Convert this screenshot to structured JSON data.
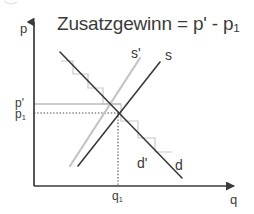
{
  "figure": {
    "kind": "economics-supply-demand-diagram",
    "width": 254,
    "height": 214,
    "background": "#ffffff",
    "title": "Zusatzgewinn = p' - p",
    "title_sub": "1",
    "title_full": "Zusatzgewinn = p' - p₁"
  },
  "axes": {
    "y_label": "p",
    "x_label": "q",
    "origin": {
      "x": 34,
      "y": 186
    },
    "y_top": 18,
    "x_right": 240,
    "axis_color": "#3a3a3a"
  },
  "ticks": {
    "y": [
      {
        "id": "p-prime",
        "label": "p'",
        "label_sub": "",
        "value_y": 104
      },
      {
        "id": "p-one",
        "label": "p",
        "label_sub": "1",
        "value_y": 113
      }
    ],
    "x": [
      {
        "id": "q-one",
        "label": "q",
        "label_sub": "1",
        "value_x": 118
      }
    ]
  },
  "guides": [
    {
      "id": "p-prime-guide",
      "style": "solid-light",
      "color": "#bdbdbd",
      "from_x": 34,
      "to_x": 121,
      "y": 104
    },
    {
      "id": "p-one-guide",
      "style": "dotted",
      "color": "#4a4a4a",
      "from_x": 34,
      "to_x": 120,
      "y": 113
    },
    {
      "id": "q-one-guide",
      "style": "dotted",
      "color": "#4a4a4a",
      "x": 118,
      "from_y": 113,
      "to_y": 186
    }
  ],
  "curves": [
    {
      "id": "demand-d",
      "label": "d",
      "label_x": 178,
      "label_y": 160,
      "color": "#3a3a3a",
      "width": 1.6,
      "x1": 60,
      "y1": 52,
      "x2": 182,
      "y2": 178
    },
    {
      "id": "supply-s",
      "label": "s",
      "label_x": 168,
      "label_y": 52,
      "color": "#3a3a3a",
      "width": 1.6,
      "x1": 78,
      "y1": 166,
      "x2": 160,
      "y2": 62
    },
    {
      "id": "supply-s-prime",
      "label": "s'",
      "label_x": 134,
      "label_y": 52,
      "color": "#c4c4c4",
      "width": 2.2,
      "x1": 70,
      "y1": 166,
      "x2": 140,
      "y2": 58
    },
    {
      "id": "demand-d-prime-steps",
      "label": "d'",
      "label_x": 140,
      "label_y": 161,
      "color": "#c4c4c4",
      "width": 1.2
    }
  ],
  "staircase": {
    "id": "marginal-revenue-steps",
    "color": "#c8c8c8",
    "width": 1.2,
    "points": [
      [
        61,
        61
      ],
      [
        73,
        61
      ],
      [
        73,
        74
      ],
      [
        88,
        74
      ],
      [
        88,
        88
      ],
      [
        103,
        88
      ],
      [
        103,
        104
      ],
      [
        121,
        104
      ],
      [
        121,
        121
      ],
      [
        138,
        121
      ],
      [
        138,
        138
      ],
      [
        155,
        138
      ],
      [
        155,
        152
      ],
      [
        172,
        152
      ]
    ]
  },
  "equilibrium": {
    "x": 118,
    "y": 113
  }
}
